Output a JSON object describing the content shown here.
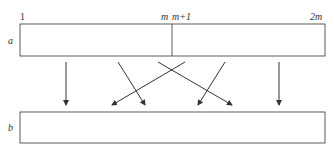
{
  "diagram": {
    "array_a": {
      "label": "a",
      "index_labels": {
        "start": "1",
        "m": "m",
        "m_plus_1": "m+1",
        "end": "2m"
      }
    },
    "array_b": {
      "label": "b"
    },
    "arrows": [
      {
        "from": [
          66,
          62
        ],
        "to": [
          66,
          105
        ]
      },
      {
        "from": [
          118,
          62
        ],
        "to": [
          145,
          105
        ]
      },
      {
        "from": [
          185,
          62
        ],
        "to": [
          112,
          105
        ]
      },
      {
        "from": [
          158,
          62
        ],
        "to": [
          232,
          105
        ]
      },
      {
        "from": [
          225,
          62
        ],
        "to": [
          198,
          105
        ]
      },
      {
        "from": [
          279,
          62
        ],
        "to": [
          279,
          105
        ]
      }
    ],
    "colors": {
      "stroke": "#333333",
      "text": "#333333"
    }
  }
}
